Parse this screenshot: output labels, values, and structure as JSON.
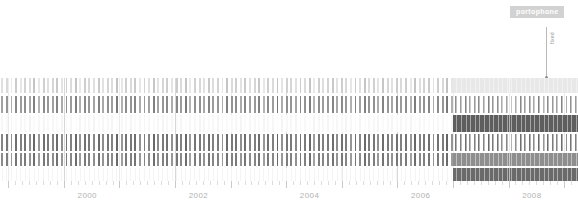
{
  "badge": {
    "label": "portophone",
    "bg": "#d2d2d2",
    "color": "#ffffff"
  },
  "annotation": {
    "label": "fixed",
    "line_color": "#b9b9b9",
    "dot_color": "#8a8a8a"
  },
  "chart_data": {
    "type": "heatmap",
    "title": "portophone",
    "xlabel": "",
    "ylabel": "",
    "grid": true,
    "legend": "none",
    "x_axis": {
      "tick_labels": [
        "2000",
        "2002",
        "2004",
        "2006",
        "2008"
      ],
      "tick_values": [
        2000,
        2002,
        2004,
        2006,
        2008
      ],
      "minor_ticks_per_major": 8,
      "xlim": [
        1998.85,
        2009.25
      ],
      "label_color": "#b2b2b2"
    },
    "columns": {
      "count": 126,
      "start_year": 1998.85,
      "end_year": 2009.25,
      "step_years": 0.0825,
      "note": "one vertical tick column per time bin across the full span"
    },
    "rows": [
      {
        "name": "row-1",
        "top_pct": 0.0,
        "height_pct": 15.0,
        "highlight_color": "#e8e8e8"
      },
      {
        "name": "row-2",
        "top_pct": 17.0,
        "height_pct": 17.0,
        "highlight_color": "#ffffff"
      },
      {
        "name": "row-3",
        "top_pct": 36.0,
        "height_pct": 16.0,
        "highlight_color": "#5e5e5e"
      },
      {
        "name": "row-4",
        "top_pct": 54.0,
        "height_pct": 17.0,
        "highlight_color": "#ffffff"
      },
      {
        "name": "row-5",
        "top_pct": 73.0,
        "height_pct": 12.0,
        "highlight_color": "#8e8e8e"
      },
      {
        "name": "row-6",
        "top_pct": 87.0,
        "height_pct": 13.0,
        "highlight_color": "#6a6a6a"
      }
    ],
    "highlight_region": {
      "start_year": 2007.0,
      "end_year": 2009.25,
      "description": "solid banded block on the right side of the plot"
    },
    "series": [
      {
        "name": "row-1",
        "values": [
          0.18,
          0.22,
          0.12,
          0.3,
          0.15,
          0.26,
          0.2,
          0.34,
          0.14,
          0.28,
          0.19,
          0.24,
          0.31,
          0.16,
          0.27,
          0.21,
          0.35,
          0.13,
          0.29,
          0.23,
          0.18,
          0.32,
          0.17,
          0.25,
          0.2,
          0.36,
          0.15,
          0.28,
          0.22,
          0.31,
          0.14,
          0.26,
          0.19,
          0.33,
          0.17,
          0.24,
          0.29,
          0.16,
          0.3,
          0.21,
          0.35,
          0.13,
          0.27,
          0.23,
          0.18,
          0.32,
          0.2,
          0.26,
          0.15,
          0.34,
          0.22,
          0.28,
          0.17,
          0.31,
          0.19,
          0.25,
          0.33,
          0.14,
          0.29,
          0.21,
          0.36,
          0.16,
          0.27,
          0.24,
          0.18,
          0.3,
          0.22,
          0.35,
          0.13,
          0.28,
          0.2,
          0.26,
          0.32,
          0.17,
          0.29,
          0.23,
          0.15,
          0.31,
          0.19,
          0.34,
          0.21,
          0.27,
          0.16,
          0.33,
          0.24,
          0.18,
          0.3,
          0.22,
          0.28,
          0.14,
          0.35,
          0.2,
          0.26,
          0.31,
          0.17,
          0.29,
          0.23,
          0.36,
          0.15,
          0.27,
          0.21,
          0.32,
          0.18,
          0.25,
          0.3,
          0.19,
          0.34,
          0.22,
          0.28,
          0.16
        ]
      },
      {
        "name": "row-2",
        "values": [
          0.55,
          0.62,
          0.48,
          0.7,
          0.58,
          0.66,
          0.52,
          0.74,
          0.45,
          0.68,
          0.6,
          0.56,
          0.72,
          0.5,
          0.64,
          0.59,
          0.76,
          0.47,
          0.69,
          0.61,
          0.54,
          0.73,
          0.51,
          0.65,
          0.57,
          0.78,
          0.46,
          0.67,
          0.63,
          0.71,
          0.49,
          0.6,
          0.55,
          0.75,
          0.53,
          0.62,
          0.68,
          0.48,
          0.7,
          0.58,
          0.77,
          0.44,
          0.66,
          0.64,
          0.52,
          0.72,
          0.59,
          0.61,
          0.47,
          0.74,
          0.63,
          0.67,
          0.5,
          0.71,
          0.56,
          0.6,
          0.73,
          0.45,
          0.68,
          0.57,
          0.79,
          0.49,
          0.65,
          0.62,
          0.53,
          0.7,
          0.64,
          0.76,
          0.43,
          0.66,
          0.58,
          0.61,
          0.72,
          0.51,
          0.69,
          0.6,
          0.46,
          0.71,
          0.55,
          0.75,
          0.63,
          0.65,
          0.48,
          0.73,
          0.62,
          0.52,
          0.7,
          0.59,
          0.67,
          0.44,
          0.77,
          0.57,
          0.64,
          0.71,
          0.5,
          0.68,
          0.61,
          0.78,
          0.47,
          0.66,
          0.58,
          0.72,
          0.54,
          0.6,
          0.69,
          0.56,
          0.75,
          0.63,
          0.67,
          0.49
        ]
      },
      {
        "name": "row-3",
        "values": [
          0.05,
          0.04,
          0.06,
          0.03,
          0.05,
          0.04,
          0.07,
          0.03,
          0.05,
          0.06,
          0.04,
          0.05,
          0.03,
          0.06,
          0.04,
          0.05,
          0.02,
          0.06,
          0.04,
          0.05,
          0.06,
          0.03,
          0.05,
          0.04,
          0.06,
          0.02,
          0.05,
          0.04,
          0.06,
          0.03,
          0.05,
          0.06,
          0.04,
          0.03,
          0.05,
          0.06,
          0.04,
          0.05,
          0.03,
          0.06,
          0.02,
          0.05,
          0.04,
          0.06,
          0.05,
          0.03,
          0.04,
          0.06,
          0.05,
          0.03,
          0.04,
          0.05,
          0.06,
          0.03,
          0.05,
          0.04,
          0.03,
          0.06,
          0.04,
          0.05,
          0.02,
          0.06,
          0.04,
          0.05,
          0.06,
          0.03,
          0.04,
          0.02,
          0.06,
          0.05,
          0.04,
          0.06,
          0.03,
          0.05,
          0.04,
          0.06,
          0.05,
          0.03,
          0.06,
          0.02,
          0.04,
          0.05,
          0.06,
          0.03,
          0.04,
          0.06,
          0.03,
          0.05,
          0.04,
          0.06,
          0.02,
          0.05,
          0.04,
          0.03,
          0.06,
          0.04,
          0.05,
          0.02,
          0.06,
          0.04,
          0.05,
          0.03,
          0.06,
          0.05,
          0.04,
          0.06,
          0.02,
          0.04,
          0.03,
          0.05
        ]
      },
      {
        "name": "row-4",
        "values": [
          0.72,
          0.8,
          0.65,
          0.85,
          0.74,
          0.82,
          0.68,
          0.88,
          0.62,
          0.84,
          0.77,
          0.71,
          0.86,
          0.66,
          0.81,
          0.75,
          0.89,
          0.63,
          0.83,
          0.78,
          0.7,
          0.87,
          0.67,
          0.8,
          0.73,
          0.9,
          0.61,
          0.82,
          0.79,
          0.85,
          0.64,
          0.76,
          0.72,
          0.88,
          0.69,
          0.78,
          0.83,
          0.65,
          0.84,
          0.74,
          0.89,
          0.6,
          0.81,
          0.79,
          0.68,
          0.86,
          0.75,
          0.77,
          0.63,
          0.87,
          0.78,
          0.82,
          0.66,
          0.85,
          0.73,
          0.76,
          0.86,
          0.61,
          0.83,
          0.74,
          0.91,
          0.65,
          0.8,
          0.78,
          0.69,
          0.84,
          0.79,
          0.88,
          0.59,
          0.81,
          0.75,
          0.77,
          0.86,
          0.67,
          0.83,
          0.76,
          0.62,
          0.85,
          0.72,
          0.88,
          0.79,
          0.8,
          0.64,
          0.86,
          0.78,
          0.68,
          0.84,
          0.75,
          0.82,
          0.6,
          0.89,
          0.74,
          0.79,
          0.85,
          0.66,
          0.83,
          0.77,
          0.9,
          0.63,
          0.81,
          0.74,
          0.86,
          0.7,
          0.76,
          0.83,
          0.73,
          0.88,
          0.78,
          0.82,
          0.65
        ]
      },
      {
        "name": "row-5",
        "values": [
          0.68,
          0.76,
          0.6,
          0.82,
          0.7,
          0.78,
          0.64,
          0.85,
          0.58,
          0.8,
          0.73,
          0.67,
          0.83,
          0.62,
          0.77,
          0.71,
          0.86,
          0.59,
          0.79,
          0.74,
          0.66,
          0.84,
          0.63,
          0.76,
          0.69,
          0.87,
          0.57,
          0.78,
          0.75,
          0.81,
          0.6,
          0.72,
          0.68,
          0.85,
          0.65,
          0.74,
          0.79,
          0.61,
          0.8,
          0.7,
          0.86,
          0.56,
          0.77,
          0.75,
          0.64,
          0.82,
          0.71,
          0.73,
          0.59,
          0.84,
          0.74,
          0.78,
          0.62,
          0.81,
          0.69,
          0.72,
          0.82,
          0.57,
          0.79,
          0.7,
          0.88,
          0.61,
          0.76,
          0.74,
          0.65,
          0.8,
          0.75,
          0.85,
          0.55,
          0.77,
          0.71,
          0.73,
          0.82,
          0.63,
          0.79,
          0.72,
          0.58,
          0.81,
          0.68,
          0.85,
          0.75,
          0.76,
          0.6,
          0.82,
          0.74,
          0.64,
          0.8,
          0.71,
          0.78,
          0.56,
          0.86,
          0.7,
          0.75,
          0.81,
          0.62,
          0.79,
          0.73,
          0.87,
          0.59,
          0.77,
          0.7,
          0.82,
          0.66,
          0.72,
          0.79,
          0.69,
          0.84,
          0.74,
          0.78,
          0.61
        ]
      }
    ]
  },
  "axis": {
    "tick_color": "#dcdcdc",
    "major_tick_color": "#c9c9c9",
    "label_color": "#b2b2b2"
  }
}
